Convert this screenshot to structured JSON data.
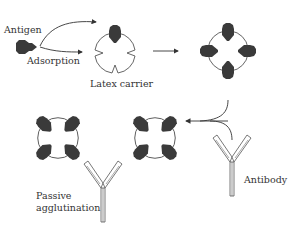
{
  "diagram": {
    "labels": {
      "antigen": "Antigen",
      "adsorption": "Adsorption",
      "latex_carrier": "Latex carrier",
      "antibody": "Antibody",
      "passive_line1": "Passive",
      "passive_line2": "agglutination"
    },
    "colors": {
      "antigen_fill": "#3a3a3a",
      "outline": "#555555",
      "text": "#333333",
      "background": "#ffffff"
    },
    "steps": [
      "Antigen adsorbed onto latex carrier",
      "Latex carrier coated with antigen",
      "Antibody added",
      "Antibody cross-links coated particles (passive agglutination)"
    ]
  }
}
